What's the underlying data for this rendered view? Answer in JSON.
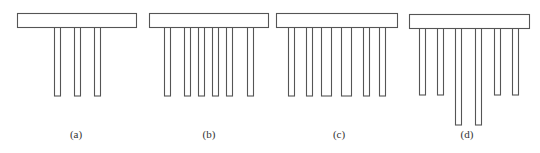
{
  "figure": {
    "panels": [
      {
        "id": "a",
        "label": "(a)",
        "label_x": 76,
        "cap": {
          "x": 17,
          "y": 13,
          "w": 119,
          "h": 14
        },
        "piles": [
          {
            "x": 54,
            "w": 6,
            "bottom": 96
          },
          {
            "x": 74,
            "w": 6,
            "bottom": 96
          },
          {
            "x": 94,
            "w": 6,
            "bottom": 96
          }
        ]
      },
      {
        "id": "b",
        "label": "(b)",
        "label_x": 209,
        "cap": {
          "x": 149,
          "y": 13,
          "w": 119,
          "h": 14
        },
        "piles": [
          {
            "x": 164,
            "w": 6,
            "bottom": 96
          },
          {
            "x": 184,
            "w": 6,
            "bottom": 96
          },
          {
            "x": 198,
            "w": 6,
            "bottom": 96
          },
          {
            "x": 212,
            "w": 6,
            "bottom": 96
          },
          {
            "x": 226,
            "w": 6,
            "bottom": 96
          },
          {
            "x": 247,
            "w": 6,
            "bottom": 96
          }
        ]
      },
      {
        "id": "c",
        "label": "(c)",
        "label_x": 339,
        "cap": {
          "x": 276,
          "y": 13,
          "w": 121,
          "h": 14
        },
        "piles": [
          {
            "x": 288,
            "w": 6,
            "bottom": 96
          },
          {
            "x": 306,
            "w": 6,
            "bottom": 96
          },
          {
            "x": 321,
            "w": 10,
            "bottom": 96
          },
          {
            "x": 341,
            "w": 10,
            "bottom": 96
          },
          {
            "x": 363,
            "w": 6,
            "bottom": 96
          },
          {
            "x": 379,
            "w": 6,
            "bottom": 96
          }
        ]
      },
      {
        "id": "d",
        "label": "(d)",
        "label_x": 467,
        "cap": {
          "x": 409,
          "y": 14,
          "w": 120,
          "h": 14
        },
        "piles": [
          {
            "x": 419,
            "w": 6,
            "bottom": 95
          },
          {
            "x": 437,
            "w": 6,
            "bottom": 95
          },
          {
            "x": 455,
            "w": 6,
            "bottom": 125
          },
          {
            "x": 475,
            "w": 6,
            "bottom": 125
          },
          {
            "x": 494,
            "w": 6,
            "bottom": 95
          },
          {
            "x": 512,
            "w": 6,
            "bottom": 95
          }
        ]
      }
    ],
    "label_y": 138,
    "colors": {
      "stroke": "#555555",
      "fill": "#ffffff",
      "text": "#333333"
    }
  }
}
